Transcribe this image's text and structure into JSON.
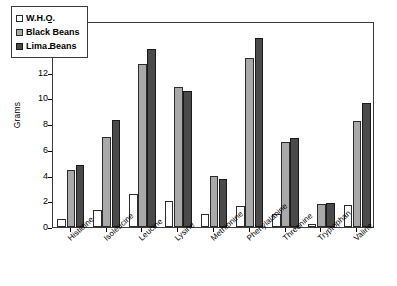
{
  "chart_data": {
    "type": "bar",
    "title": "",
    "xlabel": "",
    "ylabel": "Grams",
    "ylim": [
      0,
      16
    ],
    "yticks": [
      0,
      2,
      4,
      6,
      8,
      10,
      12,
      14,
      16
    ],
    "grid": false,
    "legend_position": "top-left",
    "categories": [
      "Histidine",
      "Isoleucine",
      "Leucine",
      "Lysine",
      "Methionine",
      "Phenylalanine",
      "Threonine",
      "Tryptophan",
      "Valine"
    ],
    "series": [
      {
        "name": "W.H.O.",
        "color": "#ffffff",
        "values": [
          0.6,
          1.3,
          2.6,
          2.0,
          1.0,
          1.6,
          1.0,
          0.2,
          1.7
        ]
      },
      {
        "name": "Black Beans",
        "color": "#a9a9a9",
        "values": [
          4.4,
          7.0,
          12.7,
          10.9,
          4.0,
          13.1,
          6.6,
          1.8,
          8.2
        ]
      },
      {
        "name": "Lima Beans",
        "color": "#4a4a4a",
        "values": [
          4.8,
          8.3,
          13.8,
          10.6,
          3.7,
          14.7,
          6.9,
          1.9,
          9.6
        ]
      }
    ]
  },
  "legend": {
    "items": [
      {
        "label": "W.H.O."
      },
      {
        "label": "Black Beans"
      },
      {
        "label": "Lima Beans"
      }
    ]
  },
  "axes": {
    "y_title": "Grams"
  }
}
